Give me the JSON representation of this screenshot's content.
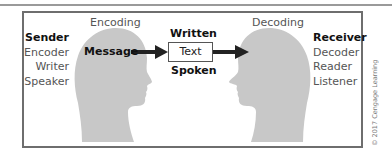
{
  "diagram": {
    "type": "communication-process",
    "sender": {
      "title": "Sender",
      "roles": [
        "Encoder",
        "Writer",
        "Speaker"
      ]
    },
    "receiver": {
      "title": "Receiver",
      "roles": [
        "Decoder",
        "Reader",
        "Listener"
      ]
    },
    "encoding_label": "Encoding",
    "decoding_label": "Decoding",
    "message_label": "Message",
    "channel": {
      "top_label": "Written",
      "box_label": "Text",
      "bottom_label": "Spoken"
    },
    "copyright": "© 2017 Cengage Learning",
    "colors": {
      "head_fill": "#c8c8c8",
      "frame_border": "#6e6e6e",
      "arrow": "#222222"
    }
  }
}
